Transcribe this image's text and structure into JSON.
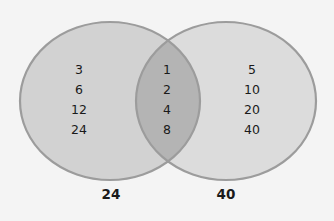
{
  "diagram": {
    "type": "venn",
    "colors": {
      "background": "#f4f4f4",
      "set_fill": "#d2d2d2",
      "set_stroke": "#9c9c9c",
      "overlap_fill": "#b6b6b6",
      "text": "#1a1a1a"
    },
    "sets": [
      {
        "label": "24",
        "only_elements": [
          "3",
          "6",
          "12",
          "24"
        ]
      },
      {
        "label": "40",
        "only_elements": [
          "5",
          "10",
          "20",
          "40"
        ]
      }
    ],
    "intersection": {
      "elements": [
        "1",
        "2",
        "4",
        "8"
      ]
    }
  }
}
